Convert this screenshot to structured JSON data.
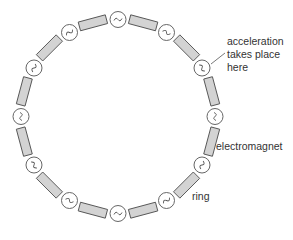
{
  "diagram": {
    "type": "particle-accelerator-ring",
    "colors": {
      "magnet_fill": "#d3d3d3",
      "stroke": "#555555",
      "label": "#333333",
      "background": "#ffffff"
    },
    "ring": {
      "cx": 118,
      "cy": 116.5,
      "r": 97
    },
    "accelerator_count": 12,
    "magnet_count": 12,
    "labels": {
      "acceleration_line1": "acceleration",
      "acceleration_line2": "takes place",
      "acceleration_line3": "here",
      "electromagnet": "electromagnet",
      "ring": "ring"
    }
  }
}
